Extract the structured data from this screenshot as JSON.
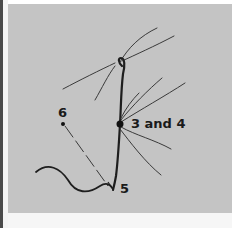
{
  "figure": {
    "type": "labeled line diagram",
    "background_color": "#c4c4c4",
    "line_color": "#2a2a2a",
    "labels": [
      {
        "id": "point-6",
        "text": "6"
      },
      {
        "id": "point-3-and-4",
        "text": "3 and 4"
      },
      {
        "id": "point-5",
        "text": "5"
      }
    ]
  }
}
